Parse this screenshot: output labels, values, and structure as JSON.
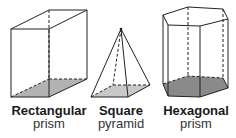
{
  "shapes": [
    {
      "name": "rectangular-prism",
      "label_bold": "Rectangular",
      "label": "prism"
    },
    {
      "name": "square-pyramid",
      "label_bold": "Square",
      "label": "pyramid"
    },
    {
      "name": "hexagonal-prism",
      "label_bold": "Hexagonal",
      "label": "prism"
    }
  ],
  "colors": {
    "stroke": "#222222",
    "base_fill": "#b3b3b3",
    "hex_base_fill": "#8a8a8a"
  }
}
